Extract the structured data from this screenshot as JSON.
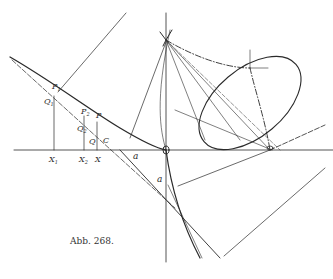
{
  "figure": {
    "caption": "Abb. 268.",
    "labels": {
      "P1": "P",
      "P1_sub": "1",
      "P2": "P",
      "P2_sub": "2",
      "P": "P",
      "Q1": "Q",
      "Q1_sub": "1",
      "Q2": "Q",
      "Q2_sub": "2",
      "Q": "Q",
      "C": "C",
      "X1": "X",
      "X1_sub": "1",
      "X2": "X",
      "X2_sub": "2",
      "X": "X",
      "a_horizontal": "a",
      "a_vertical": "a",
      "O": "O"
    },
    "colors": {
      "ink": "#2a2a2a",
      "background": "#ffffff"
    }
  }
}
